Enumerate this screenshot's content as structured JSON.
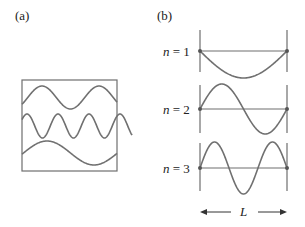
{
  "panel_a": {
    "label": "(a)",
    "box": {
      "x": 22,
      "y": 80,
      "width": 95,
      "height": 91
    },
    "waves": [
      {
        "name": "top-wave",
        "center_y": 97.5,
        "amplitude": 11.5,
        "period": 57,
        "phase_peak_x": 42,
        "x_start": 22,
        "x_end": 117
      },
      {
        "name": "middle-wave",
        "center_y": 126,
        "amplitude": 12,
        "period": 31,
        "phase_peak_x": 27,
        "x_start": 22,
        "x_end": 132
      },
      {
        "name": "bottom-wave",
        "center_y": 153,
        "amplitude": 12,
        "period": 94,
        "phase_peak_x": 47,
        "x_start": 22,
        "x_end": 117
      }
    ]
  },
  "panel_b": {
    "label": "(b)",
    "left_x": 200,
    "right_x": 287,
    "modes": [
      {
        "n_symbol": "n",
        "equals": " = ",
        "n_value": "1",
        "axis_y": 51,
        "amplitude": 27,
        "mode": 1,
        "sign": 1,
        "line_top": 30,
        "line_bottom": 72
      },
      {
        "n_symbol": "n",
        "equals": " = ",
        "n_value": "2",
        "axis_y": 109,
        "amplitude": 25,
        "mode": 2,
        "sign": -1,
        "line_top": 85,
        "line_bottom": 133
      },
      {
        "n_symbol": "n",
        "equals": " = ",
        "n_value": "3",
        "axis_y": 168,
        "amplitude": 26,
        "mode": 3,
        "sign": -1,
        "line_top": 143,
        "line_bottom": 191
      }
    ],
    "length_label": "L",
    "arrow_y": 212
  },
  "colors": {
    "stroke": "#6e6e6e",
    "wave": "#707070",
    "node": "#555555",
    "text": "#222222"
  }
}
